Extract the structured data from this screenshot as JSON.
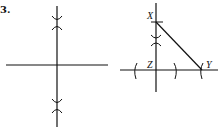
{
  "problem_number": "3.",
  "figures": [
    {
      "id": "left",
      "description": "Perpendicular bisector construction: horizontal segment with vertical line through two arc intersections",
      "points": []
    },
    {
      "id": "right",
      "description": "Right triangle construction with perpendicular at Z and hypotenuse XY",
      "points": [
        "X",
        "Z",
        "Y"
      ]
    }
  ],
  "labels": {
    "x": "X",
    "y": "Y",
    "z": "Z"
  },
  "colors": {
    "ink": "#111111",
    "background": "#ffffff"
  }
}
